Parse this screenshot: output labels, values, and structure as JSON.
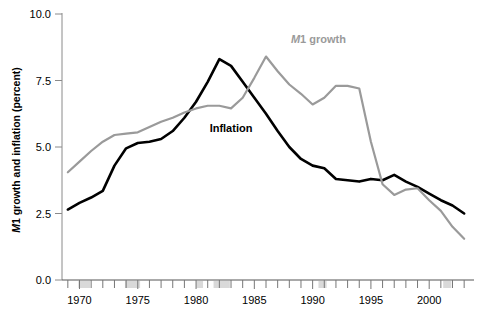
{
  "chart_data": {
    "type": "line",
    "title": "",
    "xlabel": "",
    "ylabel": "M1 growth and inflation (percent)",
    "ylabel_italic_prefix": "M",
    "ylabel_rest": "1 growth and inflation (percent)",
    "xlim": [
      1968.5,
      2003.5
    ],
    "ylim": [
      0.0,
      10.0
    ],
    "grid": false,
    "legend_position": "inline-annotations",
    "y_ticks": [
      0.0,
      2.5,
      5.0,
      7.5,
      10.0
    ],
    "y_tick_labels": [
      "0.0",
      "2.5",
      "5.0",
      "7.5",
      "10.0"
    ],
    "x_ticks": [
      1969,
      1970,
      1971,
      1972,
      1973,
      1974,
      1975,
      1976,
      1977,
      1978,
      1979,
      1980,
      1981,
      1982,
      1983,
      1984,
      1985,
      1986,
      1987,
      1988,
      1989,
      1990,
      1991,
      1992,
      1993,
      1994,
      1995,
      1996,
      1997,
      1998,
      1999,
      2000,
      2001,
      2002,
      2003
    ],
    "x_tick_labels_shown": [
      "1970",
      "1975",
      "1980",
      "1985",
      "1990",
      "1995",
      "2000"
    ],
    "x_labeled_years": [
      1970,
      1975,
      1980,
      1985,
      1990,
      1995,
      2000
    ],
    "annotations": [
      {
        "text": "Inflation",
        "italic_prefix": "",
        "x": 1983.0,
        "y": 5.55,
        "color": "#000000",
        "name": "inflation-label"
      },
      {
        "text": "M1 growth",
        "italic_prefix": "M",
        "rest": "1 growth",
        "x": 1990.5,
        "y": 8.9,
        "color": "#9a9a9a",
        "name": "m1-growth-label"
      }
    ],
    "recession_bands": [
      {
        "start": 1969.9,
        "end": 1970.9
      },
      {
        "start": 1973.9,
        "end": 1975.2
      },
      {
        "start": 1980.0,
        "end": 1980.6
      },
      {
        "start": 1981.5,
        "end": 1982.9
      },
      {
        "start": 1990.5,
        "end": 1991.2
      },
      {
        "start": 2001.2,
        "end": 2001.9
      }
    ],
    "series": [
      {
        "name": "Inflation",
        "color": "#000000",
        "width": 2.6,
        "x": [
          1969,
          1970,
          1971,
          1972,
          1973,
          1974,
          1975,
          1976,
          1977,
          1978,
          1979,
          1980,
          1981,
          1982,
          1983,
          1984,
          1985,
          1986,
          1987,
          1988,
          1989,
          1990,
          1991,
          1992,
          1993,
          1994,
          1995,
          1996,
          1997,
          1998,
          1999,
          2000,
          2001,
          2002,
          2003
        ],
        "values": [
          2.65,
          2.9,
          3.1,
          3.35,
          4.3,
          4.95,
          5.15,
          5.2,
          5.3,
          5.6,
          6.1,
          6.7,
          7.45,
          8.3,
          8.05,
          7.45,
          6.85,
          6.25,
          5.6,
          5.0,
          4.55,
          4.3,
          4.2,
          3.8,
          3.75,
          3.7,
          3.8,
          3.75,
          3.95,
          3.7,
          3.5,
          3.25,
          3.0,
          2.8,
          2.5
        ]
      },
      {
        "name": "M1 growth",
        "color": "#9a9a9a",
        "width": 2.2,
        "x": [
          1969,
          1970,
          1971,
          1972,
          1973,
          1974,
          1975,
          1976,
          1977,
          1978,
          1979,
          1980,
          1981,
          1982,
          1983,
          1984,
          1985,
          1986,
          1987,
          1988,
          1989,
          1990,
          1991,
          1992,
          1993,
          1994,
          1995,
          1996,
          1997,
          1998,
          1999,
          2000,
          2001,
          2002,
          2003
        ],
        "values": [
          4.05,
          4.45,
          4.85,
          5.2,
          5.45,
          5.5,
          5.55,
          5.75,
          5.95,
          6.1,
          6.3,
          6.45,
          6.55,
          6.55,
          6.45,
          6.85,
          7.6,
          8.4,
          7.85,
          7.35,
          7.0,
          6.6,
          6.85,
          7.3,
          7.3,
          7.2,
          5.2,
          3.6,
          3.2,
          3.4,
          3.45,
          3.0,
          2.6,
          2.0,
          1.55
        ]
      }
    ]
  },
  "figure": {
    "background": "#ffffff",
    "axis_color": "#888888",
    "recession_band_color": "#d9d9d9",
    "black": "#000000",
    "gray": "#9a9a9a"
  }
}
